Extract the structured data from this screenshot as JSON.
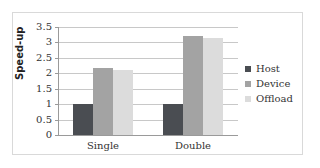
{
  "chart_data": {
    "type": "bar",
    "title": "",
    "xlabel": "",
    "ylabel": "Speed-up",
    "ylim": [
      0,
      3.5
    ],
    "yticks": [
      "0",
      "0.5",
      "1",
      "1.5",
      "2",
      "2.5",
      "3",
      "3.5"
    ],
    "grid": true,
    "legend_position": "right",
    "categories": [
      "Single",
      "Double"
    ],
    "series": [
      {
        "name": "Host",
        "color": "#4a4d52",
        "values": [
          1.0,
          1.0
        ]
      },
      {
        "name": "Device",
        "color": "#a3a3a3",
        "values": [
          2.17,
          3.2
        ]
      },
      {
        "name": "Offload",
        "color": "#dcdcdc",
        "values": [
          2.12,
          3.15
        ]
      }
    ]
  }
}
